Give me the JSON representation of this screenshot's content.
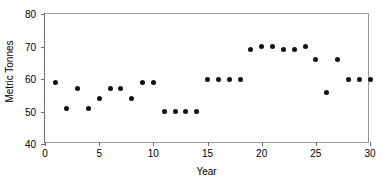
{
  "chart_data": {
    "type": "scatter",
    "title": "",
    "xlabel": "Year",
    "ylabel": "Metric Tonnes",
    "xlim": [
      0,
      30
    ],
    "ylim": [
      40,
      80
    ],
    "xticks": [
      0,
      5,
      10,
      15,
      20,
      25,
      30
    ],
    "yticks": [
      40,
      50,
      60,
      70,
      80
    ],
    "grid": false,
    "legend": null,
    "marker_color": "#111111",
    "x": [
      1,
      2,
      3,
      4,
      5,
      6,
      7,
      8,
      9,
      10,
      11,
      12,
      13,
      14,
      15,
      16,
      17,
      18,
      19,
      20,
      21,
      22,
      23,
      24,
      25,
      26,
      27,
      28,
      29,
      30
    ],
    "values": [
      59,
      51,
      57,
      51,
      54,
      57,
      57,
      54,
      59,
      59,
      50,
      50,
      50,
      50,
      60,
      60,
      60,
      60,
      69,
      70,
      70,
      69,
      69,
      70,
      66,
      56,
      66,
      60,
      60,
      60
    ],
    "series": [
      {
        "name": "Metric Tonnes",
        "values": [
          59,
          51,
          57,
          51,
          54,
          57,
          57,
          54,
          59,
          59,
          50,
          50,
          50,
          50,
          60,
          60,
          60,
          60,
          69,
          70,
          70,
          69,
          69,
          70,
          66,
          56,
          66,
          60,
          60,
          60
        ]
      }
    ]
  }
}
